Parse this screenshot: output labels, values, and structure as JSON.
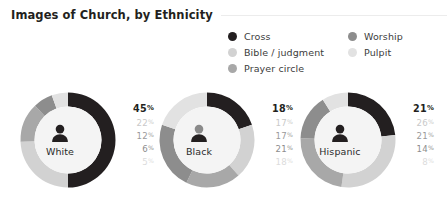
{
  "header": {
    "title": "Images of Church, by Ethnicity"
  },
  "legend": {
    "items": [
      {
        "label": "Cross",
        "color": "#231f20"
      },
      {
        "label": "Worship",
        "color": "#8d8d8d"
      },
      {
        "label": "Bible / judgment",
        "color": "#d2d2d2"
      },
      {
        "label": "Pulpit",
        "color": "#e2e2e2"
      },
      {
        "label": "Prayer circle",
        "color": "#a8a8a8"
      }
    ]
  },
  "chart_data": {
    "type": "pie",
    "title": "Images of Church, by Ethnicity",
    "xlabel": "",
    "ylabel": "",
    "legend_position": "top-right",
    "grid": false,
    "units": "%",
    "categories": [
      "Cross",
      "Bible / judgment",
      "Prayer circle",
      "Worship",
      "Pulpit"
    ],
    "category_colors": [
      "#231f20",
      "#d2d2d2",
      "#a8a8a8",
      "#8d8d8d",
      "#e2e2e2"
    ],
    "groups": [
      {
        "label": "White",
        "icon": "person-icon",
        "values": [
          45,
          22,
          12,
          6,
          5
        ],
        "value_labels": [
          "45",
          "22",
          "12",
          "6",
          "5"
        ],
        "value_colors": [
          "#231f20",
          "#c9c9c9",
          "#9a9a9a",
          "#8d8d8d",
          "#dcdcdc"
        ]
      },
      {
        "label": "Black",
        "icon": "person-icon",
        "values": [
          18,
          17,
          17,
          21,
          18
        ],
        "value_labels": [
          "18",
          "17",
          "17",
          "21",
          "18"
        ],
        "value_colors": [
          "#231f20",
          "#c9c9c9",
          "#9a9a9a",
          "#8d8d8d",
          "#dcdcdc"
        ]
      },
      {
        "label": "Hispanic",
        "icon": "person-icon",
        "values": [
          21,
          26,
          21,
          14,
          8
        ],
        "value_labels": [
          "21",
          "26",
          "21",
          "14",
          "8"
        ],
        "value_colors": [
          "#231f20",
          "#c9c9c9",
          "#9a9a9a",
          "#8d8d8d",
          "#dcdcdc"
        ]
      }
    ]
  }
}
